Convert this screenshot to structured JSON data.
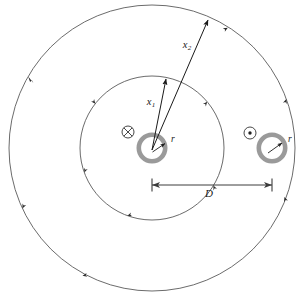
{
  "figure": {
    "type": "physics-diagram",
    "background_color": "#ffffff"
  },
  "labels": {
    "x1": {
      "base": "x",
      "subscript": "1",
      "full": "x₁"
    },
    "x2": {
      "base": "x",
      "subscript": "2",
      "full": "x₂"
    },
    "r_left": "r",
    "r_right": "r",
    "separation": "D"
  },
  "colors": {
    "field_line": "#555555",
    "conductor_ring": "#9a9a9a",
    "conductor_ring_inner": "#ffffff",
    "leader_line": "#1a1a1a",
    "dimension_line": "#4a4a4a",
    "current_symbol": "#333333",
    "text": "#1a1a1a"
  },
  "geometry": {
    "outer_field_circle": {
      "cx": 152,
      "cy": 148,
      "r": 143
    },
    "inner_field_circle": {
      "cx": 152,
      "cy": 148,
      "r": 72
    },
    "conductor_left": {
      "cx": 152,
      "cy": 148,
      "r_outer": 15.5,
      "r_inner": 11
    },
    "conductor_right": {
      "cx": 272,
      "cy": 148,
      "r_outer": 15.5,
      "r_inner": 11
    },
    "separation_line": {
      "x_start": 152,
      "x_end": 272,
      "y": 185
    }
  },
  "current_symbols": {
    "left": {
      "glyph": "cross-in-circle",
      "meaning": "current into page",
      "cx": 128,
      "cy": 132,
      "r": 6
    },
    "right": {
      "glyph": "dot-in-circle",
      "meaning": "current out of page",
      "cx": 250,
      "cy": 133,
      "r": 6
    }
  },
  "vectors": {
    "x1": {
      "from_x": 152,
      "from_y": 150,
      "to_x": 165,
      "to_y": 78
    },
    "x2": {
      "from_x": 152,
      "from_y": 150,
      "to_x": 209,
      "to_y": 19
    }
  },
  "field_arrowheads": {
    "outer_circle_angles_deg": [
      150,
      205,
      258,
      310,
      20,
      58
    ],
    "inner_circle_angles_deg": [
      142,
      200,
      250,
      300,
      40
    ]
  }
}
